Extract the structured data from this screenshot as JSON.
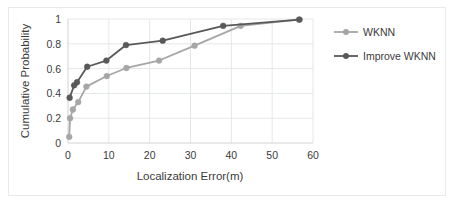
{
  "chart_data": {
    "type": "line",
    "title": "",
    "subtitle": "",
    "xlabel": "Localization Error(m)",
    "ylabel": "Cumulative Probability",
    "xlim": [
      0,
      60
    ],
    "ylim": [
      0,
      1
    ],
    "xticks": [
      0,
      10,
      20,
      30,
      40,
      50,
      60
    ],
    "xtick_labels": [
      "0",
      "10",
      "20",
      "30",
      "40",
      "50",
      "60"
    ],
    "yticks": [
      0,
      0.2,
      0.4,
      0.6,
      0.8,
      1
    ],
    "ytick_labels": [
      "0",
      "0.2",
      "0.4",
      "0.6",
      "0.8",
      "1"
    ],
    "grid": "horizontal-and-vertical-light",
    "legend_position": "right",
    "markers": "circle",
    "series": [
      {
        "name": "WKNN",
        "color": "#a6a6a6",
        "x": [
          0.3,
          0.5,
          1.2,
          2.5,
          4.5,
          9.5,
          14.3,
          22.3,
          31.0,
          42.3,
          56.5
        ],
        "y": [
          0.05,
          0.2,
          0.27,
          0.33,
          0.455,
          0.54,
          0.605,
          0.665,
          0.785,
          0.945,
          0.995
        ]
      },
      {
        "name": "Improve WKNN",
        "color": "#595959",
        "x": [
          0.4,
          1.5,
          2.2,
          4.7,
          9.4,
          14.2,
          23.2,
          38.0,
          56.7
        ],
        "y": [
          0.365,
          0.465,
          0.49,
          0.615,
          0.665,
          0.79,
          0.825,
          0.945,
          0.995
        ]
      }
    ]
  },
  "legend": {
    "items": [
      {
        "label": "WKNN",
        "color": "#a6a6a6"
      },
      {
        "label": "Improve WKNN",
        "color": "#595959"
      }
    ]
  },
  "axes": {
    "x_title": "Localization Error(m)",
    "y_title": "Cumulative Probability"
  },
  "colors": {
    "series_light": "#a6a6a6",
    "series_dark": "#595959",
    "grid": "#e4e7ea",
    "axis": "#cfd3d6",
    "text": "#3b3b3b",
    "background": "#ffffff"
  }
}
